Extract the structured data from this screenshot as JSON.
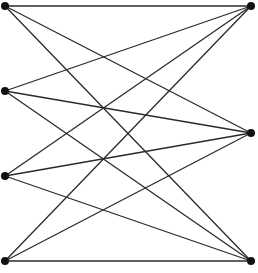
{
  "diagram": {
    "type": "complete-bipartite-graph",
    "name": "K4,3",
    "colors": {
      "edge": "#2a2a2a",
      "node": "#111111",
      "background": "#ffffff"
    },
    "nodes": [
      {
        "id": "L1",
        "side": "left",
        "x": 5,
        "y": 6
      },
      {
        "id": "L2",
        "side": "left",
        "x": 5,
        "y": 91
      },
      {
        "id": "L3",
        "side": "left",
        "x": 5,
        "y": 176
      },
      {
        "id": "L4",
        "side": "left",
        "x": 5,
        "y": 261
      },
      {
        "id": "R1",
        "side": "right",
        "x": 251,
        "y": 6
      },
      {
        "id": "R2",
        "side": "right",
        "x": 251,
        "y": 133
      },
      {
        "id": "R3",
        "side": "right",
        "x": 251,
        "y": 261
      }
    ],
    "edges": [
      [
        "L1",
        "R1"
      ],
      [
        "L1",
        "R2"
      ],
      [
        "L1",
        "R3"
      ],
      [
        "L2",
        "R1"
      ],
      [
        "L2",
        "R2"
      ],
      [
        "L2",
        "R3"
      ],
      [
        "L3",
        "R1"
      ],
      [
        "L3",
        "R2"
      ],
      [
        "L3",
        "R3"
      ],
      [
        "L4",
        "R1"
      ],
      [
        "L4",
        "R2"
      ],
      [
        "L4",
        "R3"
      ]
    ]
  }
}
